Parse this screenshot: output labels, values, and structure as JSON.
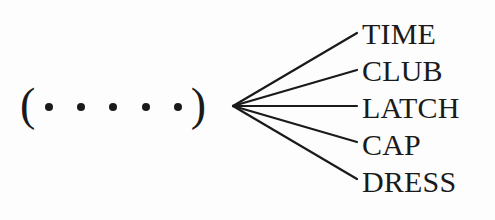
{
  "figure": {
    "type": "fan-out-diagram",
    "background_color": "#fdfdfd",
    "ink_color": "#1a1a1a",
    "source": {
      "open_paren": "(",
      "close_paren": ")",
      "dot_glyph": "•",
      "dot_count": 5,
      "dots": [
        "•",
        "•",
        "•",
        "•",
        "•"
      ]
    },
    "labels": [
      {
        "text": "TIME"
      },
      {
        "text": "CLUB"
      },
      {
        "text": "LATCH"
      },
      {
        "text": "CAP"
      },
      {
        "text": "DRESS"
      }
    ],
    "connectors": {
      "vertex_x": 233,
      "vertex_y": 106,
      "end_x": 357,
      "end_y": [
        33,
        70,
        106,
        142,
        179
      ],
      "stroke_color": "#1a1a1a",
      "stroke_width": 2.2
    }
  }
}
